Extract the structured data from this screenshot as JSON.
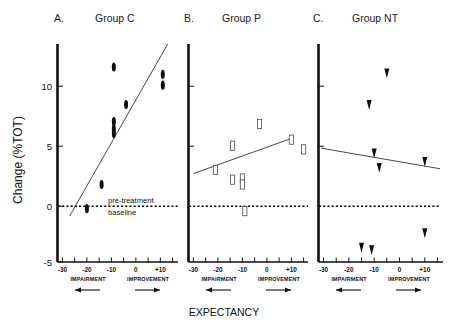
{
  "figure": {
    "y_axis_label": "Change (%TOT)",
    "x_axis_label": "EXPECTANCY",
    "baseline_label_line1": "pre-treatment",
    "baseline_label_line2": "baseline",
    "y_ticks": [
      "10",
      "5",
      "0",
      "-5"
    ],
    "x_ticks": [
      "-30",
      "-20",
      "-10",
      "0",
      "+10"
    ],
    "direction_left": "IMPAIRMENT",
    "direction_right": "IMPROVEMENT"
  },
  "panels": [
    {
      "letter": "A.",
      "title": "Group C"
    },
    {
      "letter": "B.",
      "title": "Group P"
    },
    {
      "letter": "C.",
      "title": "Group NT"
    }
  ],
  "chart_data": {
    "type": "scatter",
    "title": "",
    "xlabel": "EXPECTANCY",
    "ylabel": "Change (%TOT)",
    "xlim": [
      -32,
      17
    ],
    "ylim": [
      -5,
      13
    ],
    "grid": false,
    "legend": "none",
    "annotations": [
      {
        "text": "pre-treatment baseline",
        "y": 0,
        "style": "dotted-horizontal-line"
      },
      {
        "text": "IMPAIRMENT",
        "direction": "left-arrow",
        "axis": "x"
      },
      {
        "text": "IMPROVEMENT",
        "direction": "right-arrow",
        "axis": "x"
      }
    ],
    "panels": [
      {
        "name": "A. Group C",
        "marker": "filled-ellipse",
        "points": [
          {
            "x": -20,
            "y": -0.6
          },
          {
            "x": -14,
            "y": 1.4
          },
          {
            "x": -9,
            "y": 11.1
          },
          {
            "x": -9,
            "y": 6.6
          },
          {
            "x": -9,
            "y": 6.0
          },
          {
            "x": -9,
            "y": 5.6
          },
          {
            "x": -4,
            "y": 8.0
          },
          {
            "x": 11,
            "y": 10.5
          },
          {
            "x": 11,
            "y": 9.6
          }
        ],
        "fit_line": {
          "x1": -27,
          "y1": -1.2,
          "x2": 13,
          "y2": 13.0
        }
      },
      {
        "name": "B. Group P",
        "marker": "open-rectangle",
        "points": [
          {
            "x": -21,
            "y": 2.6
          },
          {
            "x": -14,
            "y": 4.6
          },
          {
            "x": -14,
            "y": 1.8
          },
          {
            "x": -10,
            "y": 1.9
          },
          {
            "x": -10,
            "y": 1.4
          },
          {
            "x": -9,
            "y": -0.8
          },
          {
            "x": -3,
            "y": 6.4
          },
          {
            "x": 10,
            "y": 5.1
          },
          {
            "x": 15,
            "y": 4.3
          }
        ],
        "fit_line": {
          "x1": -30,
          "y1": 2.3,
          "x2": 10,
          "y2": 5.2
        }
      },
      {
        "name": "C. Group NT",
        "marker": "filled-triangle",
        "points": [
          {
            "x": -5,
            "y": 10.6
          },
          {
            "x": -12,
            "y": 8.0
          },
          {
            "x": -10,
            "y": 4.0
          },
          {
            "x": -8,
            "y": 2.8
          },
          {
            "x": 10,
            "y": 3.3
          },
          {
            "x": 10,
            "y": -2.6
          },
          {
            "x": -15,
            "y": -3.8
          },
          {
            "x": -11,
            "y": -4.0
          }
        ],
        "fit_line": {
          "x1": -31,
          "y1": 4.4,
          "x2": 16,
          "y2": 2.7
        }
      }
    ]
  }
}
